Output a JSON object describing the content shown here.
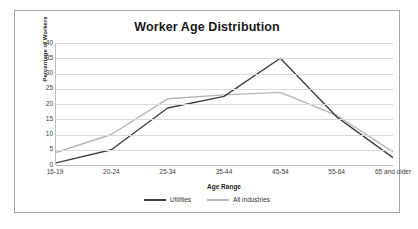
{
  "chart_data": {
    "type": "line",
    "title": "Worker Age Distribution",
    "xlabel": "Age Range",
    "ylabel": "Percentage of Workers",
    "categories": [
      "16-19",
      "20-24",
      "25-34",
      "35-44",
      "45-54",
      "55-64",
      "65 and older"
    ],
    "ylim": [
      0,
      40
    ],
    "yticks": [
      0,
      5,
      10,
      15,
      20,
      25,
      30,
      35,
      40
    ],
    "grid": "horizontal",
    "legend_position": "bottom",
    "series": [
      {
        "name": "Utilities",
        "color": "#3f3f3f",
        "values": [
          0.6,
          5.0,
          18.7,
          22.5,
          35.0,
          15.8,
          2.4
        ]
      },
      {
        "name": "All industries",
        "color": "#b5b5b5",
        "values": [
          4.0,
          10.0,
          21.7,
          23.0,
          23.8,
          16.3,
          4.3
        ]
      }
    ]
  },
  "frame": {
    "border_color": "#a6a6a6",
    "background": "#ffffff"
  }
}
